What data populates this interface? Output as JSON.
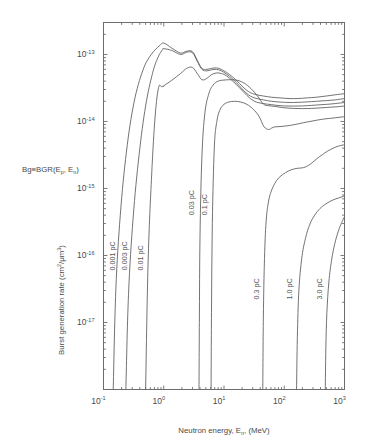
{
  "figure": {
    "background": "#ffffff",
    "curve_color": "#5a5a5a",
    "axis_color": "#6d6d6d",
    "text_color": "#4a4a4a"
  },
  "annotation": {
    "text": "Bg≡BGR(E",
    "sub1": "p",
    "mid": ", E",
    "sub2": "n",
    "close": ")",
    "full": "Bg≡BGR(Ep, En)"
  },
  "axes": {
    "x": {
      "title_main": "Neutron energy, E",
      "title_sub": "n",
      "title_tail": ", (MeV)",
      "title_full": "Neutron energy, En, (MeV)",
      "scale": "log",
      "min": 0.1,
      "max": 1000,
      "tick_mantissa": "10",
      "ticks": [
        {
          "value": 0.1,
          "exp": "-1"
        },
        {
          "value": 1,
          "exp": "0"
        },
        {
          "value": 10,
          "exp": "1"
        },
        {
          "value": 100,
          "exp": "2"
        },
        {
          "value": 1000,
          "exp": "3"
        }
      ]
    },
    "y": {
      "title_main": "Burst generation rate (cm",
      "title_sup1": "2",
      "title_mid": "/μm",
      "title_sup2": "3",
      "title_tail": ")",
      "title_full": "Burst generation rate (cm2/μm3)",
      "scale": "log",
      "min": 1e-18,
      "max": 3e-13,
      "tick_mantissa": "10",
      "ticks": [
        {
          "value": 1e-13,
          "exp": "-13"
        },
        {
          "value": 1e-14,
          "exp": "-14"
        },
        {
          "value": 1e-15,
          "exp": "-15"
        },
        {
          "value": 1e-16,
          "exp": "-16"
        },
        {
          "value": 1e-17,
          "exp": "-17"
        }
      ]
    }
  },
  "chart_data": {
    "type": "line",
    "title": "",
    "subtitle": "",
    "xlabel": "Neutron energy, En, (MeV)",
    "ylabel": "Burst generation rate (cm2/μm3)",
    "xscale": "log",
    "yscale": "log",
    "xlim": [
      0.1,
      1000
    ],
    "ylim": [
      1e-18,
      3e-13
    ],
    "grid": false,
    "legend": "inline-curve-labels",
    "annotations": [
      "Bg≡BGR(Ep, En)"
    ],
    "series": [
      {
        "name": "0.001 pC",
        "label": "0.001 pC",
        "label_x": 0.155,
        "label_y": 6e-17,
        "x": [
          0.145,
          0.16,
          0.19,
          0.24,
          0.32,
          0.45,
          0.62,
          0.85,
          1.0,
          1.35,
          1.9,
          2.4,
          3.0,
          3.6,
          4.3,
          5.2,
          6.2,
          7.5,
          9.0,
          11,
          14,
          18,
          24,
          32,
          45,
          62,
          85,
          120,
          170,
          240,
          340,
          500,
          700,
          1000
        ],
        "y": [
          1e-18,
          3e-17,
          4e-16,
          3.5e-15,
          1.9e-14,
          5.8e-14,
          1e-13,
          1.35e-13,
          1.48e-13,
          1.25e-13,
          1.05e-13,
          1.12e-13,
          1.1e-13,
          8.2e-14,
          6.2e-14,
          6e-14,
          6.2e-14,
          6.3e-14,
          6e-14,
          5.4e-14,
          4.6e-14,
          3.7e-14,
          2.9e-14,
          2.55e-14,
          2.4e-14,
          2.3e-14,
          2.25e-14,
          2.2e-14,
          2.2e-14,
          2.25e-14,
          2.3e-14,
          2.4e-14,
          2.5e-14,
          2.6e-14
        ]
      },
      {
        "name": "0.003 pC",
        "label": "0.003 pC",
        "label_x": 0.245,
        "label_y": 6e-17,
        "x": [
          0.235,
          0.26,
          0.31,
          0.39,
          0.5,
          0.65,
          0.8,
          0.95,
          1.0,
          1.35,
          1.9,
          2.4,
          3.0,
          3.6,
          4.3,
          5.2,
          6.2,
          7.5,
          9.0,
          11,
          14,
          18,
          24,
          32,
          45,
          62,
          85,
          120,
          170,
          240,
          340,
          500,
          700,
          1000
        ],
        "y": [
          1e-18,
          2.6e-17,
          3.6e-16,
          3.2e-15,
          1.7e-14,
          5.2e-14,
          9e-14,
          1.18e-13,
          1.22e-13,
          1.15e-13,
          1e-13,
          1.08e-13,
          1.06e-13,
          7.9e-14,
          6e-14,
          5.7e-14,
          5.9e-14,
          6e-14,
          5.7e-14,
          5.1e-14,
          4.3e-14,
          3.4e-14,
          2.6e-14,
          2.25e-14,
          2.1e-14,
          2e-14,
          1.95e-14,
          1.92e-14,
          1.93e-14,
          1.96e-14,
          2e-14,
          2.05e-14,
          2.1e-14,
          2.2e-14
        ]
      },
      {
        "name": "0.01 pC",
        "label": "0.01 pC",
        "label_x": 0.46,
        "label_y": 6e-17,
        "x": [
          0.5,
          0.55,
          0.63,
          0.72,
          0.82,
          0.92,
          0.99,
          1.0,
          1.35,
          1.9,
          2.4,
          3.0,
          3.6,
          4.3,
          5.2,
          6.2,
          7.5,
          9.0,
          11,
          14,
          18,
          24,
          32,
          45,
          62,
          85,
          120,
          170,
          240,
          340,
          500,
          700,
          1000
        ],
        "y": [
          1e-18,
          8e-17,
          1.6e-15,
          1.2e-14,
          3.2e-14,
          3.3e-14,
          3.35e-14,
          3.4e-14,
          4.1e-14,
          5.2e-14,
          6.2e-14,
          6.4e-14,
          5.2e-14,
          4.2e-14,
          4.4e-14,
          5e-14,
          5.3e-14,
          5.2e-14,
          4.8e-14,
          4e-14,
          3.2e-14,
          2.45e-14,
          2e-14,
          1.85e-14,
          1.78e-14,
          1.72e-14,
          1.7e-14,
          1.7e-14,
          1.72e-14,
          1.76e-14,
          1.8e-14,
          1.85e-14,
          1.92e-14
        ]
      },
      {
        "name": "0.03 pC",
        "label": "0.03 pC",
        "label_x": 3.2,
        "label_y": 4e-16,
        "x": [
          3.85,
          3.9,
          4.0,
          4.3,
          4.8,
          5.6,
          6.6,
          8.0,
          10,
          13,
          17,
          22,
          28,
          36,
          45,
          55,
          70,
          90,
          120,
          170,
          240,
          340,
          500,
          700,
          1000
        ],
        "y": [
          1e-18,
          1e-17,
          2e-16,
          3e-15,
          1.3e-14,
          2.6e-14,
          3.5e-14,
          4e-14,
          4.15e-14,
          4.2e-14,
          4.1e-14,
          3.7e-14,
          3.1e-14,
          2.4e-14,
          1.82e-14,
          1.72e-14,
          1.68e-14,
          1.62e-14,
          1.58e-14,
          1.56e-14,
          1.56e-14,
          1.58e-14,
          1.62e-14,
          1.65e-14,
          1.7e-14
        ]
      },
      {
        "name": "0.1 pC",
        "label": "0.1 pC",
        "label_x": 5.3,
        "label_y": 4e-16,
        "x": [
          6.1,
          6.2,
          6.4,
          6.9,
          7.6,
          8.6,
          10,
          12,
          15,
          19,
          24,
          30,
          38,
          46,
          55,
          62,
          70,
          85,
          110,
          150,
          210,
          300,
          430,
          620,
          1000
        ],
        "y": [
          1e-18,
          1.4e-17,
          3e-16,
          4e-15,
          1e-14,
          1.5e-14,
          1.8e-14,
          1.95e-14,
          2e-14,
          1.95e-14,
          1.8e-14,
          1.55e-14,
          1.2e-14,
          8.4e-15,
          7.6e-15,
          8e-15,
          8.3e-15,
          8.4e-15,
          8.6e-15,
          9e-15,
          9.6e-15,
          1.02e-14,
          1.08e-14,
          1.12e-14,
          1.18e-14
        ]
      },
      {
        "name": "0.3 pC",
        "label": "0.3 pC",
        "label_x": 38,
        "label_y": 2.2e-17,
        "x": [
          44,
          45,
          47,
          50,
          55,
          62,
          72,
          85,
          105,
          130,
          165,
          210,
          270,
          350,
          430,
          520,
          650,
          800,
          1000
        ],
        "y": [
          1e-18,
          1.2e-17,
          9e-17,
          3.2e-16,
          6.5e-16,
          9.5e-16,
          1.25e-15,
          1.5e-15,
          1.72e-15,
          1.9e-15,
          2e-15,
          2.05e-15,
          2.3e-15,
          2.8e-15,
          3.2e-15,
          3.6e-15,
          4e-15,
          4.3e-15,
          4.5e-15
        ]
      },
      {
        "name": "1.0 pC",
        "label": "1.0 pC",
        "label_x": 135,
        "label_y": 2.2e-17,
        "x": [
          160,
          165,
          175,
          195,
          225,
          265,
          320,
          390,
          480,
          590,
          720,
          870,
          1000
        ],
        "y": [
          1e-18,
          6e-18,
          3e-17,
          9e-17,
          1.8e-16,
          2.9e-16,
          4e-16,
          5e-16,
          5.8e-16,
          6.5e-16,
          7e-16,
          7.4e-16,
          7.8e-16
        ]
      },
      {
        "name": "3.0 pC",
        "label": "3.0 pC",
        "label_x": 420,
        "label_y": 2.2e-17,
        "x": [
          480,
          490,
          510,
          550,
          610,
          690,
          790,
          900,
          1000
        ],
        "y": [
          1e-18,
          4e-18,
          1.4e-17,
          4e-17,
          8.5e-17,
          1.5e-16,
          2.3e-16,
          3.1e-16,
          3.8e-16
        ]
      }
    ]
  }
}
